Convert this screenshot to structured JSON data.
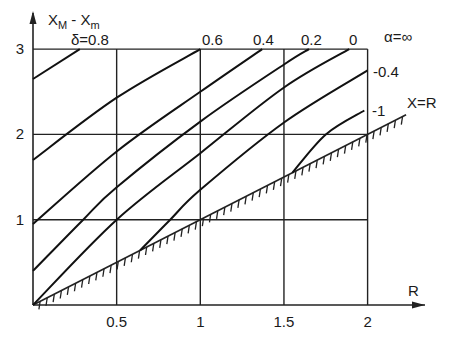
{
  "chart_data": {
    "type": "line",
    "title": "",
    "xlabel": "R",
    "ylabel": "X_M - X_m",
    "ylabel_main": "X",
    "ylabel_sub1": "M",
    "ylabel_dash": " - ",
    "ylabel_main2": "X",
    "ylabel_sub2": "m",
    "xlim": [
      0,
      2
    ],
    "ylim": [
      0,
      3
    ],
    "grid": true,
    "x_ticks": [
      {
        "value": 0.5,
        "label": "0.5"
      },
      {
        "value": 1,
        "label": "1"
      },
      {
        "value": 1.5,
        "label": "1.5"
      },
      {
        "value": 2,
        "label": "2"
      }
    ],
    "y_ticks": [
      {
        "value": 1,
        "label": "1"
      },
      {
        "value": 2,
        "label": "2"
      },
      {
        "value": 3,
        "label": "3"
      }
    ],
    "parameter_name": "δ",
    "annotations": {
      "delta_label": "δ=0.8",
      "alpha_label": "α=∞",
      "boundary_label": "X=R"
    },
    "series": [
      {
        "name": "δ=0.8",
        "label": "δ=0.8",
        "x": [
          0,
          0.28
        ],
        "y": [
          2.65,
          3.0
        ]
      },
      {
        "name": "δ=0.6",
        "label": "0.6",
        "x": [
          0,
          0.5,
          1.0
        ],
        "y": [
          1.7,
          2.43,
          3.0
        ]
      },
      {
        "name": "δ=0.4",
        "label": "0.4",
        "x": [
          0,
          0.5,
          1.0,
          1.37
        ],
        "y": [
          0.95,
          1.8,
          2.5,
          3.0
        ]
      },
      {
        "name": "δ=0.2",
        "label": "0.2",
        "x": [
          0,
          0.3,
          0.5,
          1.0,
          1.5,
          1.65
        ],
        "y": [
          0.4,
          1.0,
          1.38,
          2.15,
          2.82,
          3.0
        ]
      },
      {
        "name": "δ=0",
        "label": "0",
        "x": [
          0,
          0.5,
          1.0,
          1.5,
          1.89
        ],
        "y": [
          0,
          1.0,
          1.78,
          2.55,
          3.0
        ]
      },
      {
        "name": "δ=-0.4",
        "label": "-0.4",
        "x": [
          0.64,
          0.82,
          1.0,
          1.5,
          2.0
        ],
        "y": [
          0.64,
          1.0,
          1.35,
          2.14,
          2.75
        ]
      },
      {
        "name": "δ=-1",
        "label": "-1",
        "x": [
          1.55,
          1.75,
          1.98
        ],
        "y": [
          1.55,
          2.0,
          2.28
        ]
      }
    ],
    "boundary_line": {
      "name": "X=R",
      "x": [
        0,
        2.23
      ],
      "y": [
        0,
        2.23
      ],
      "style": "hatched"
    }
  }
}
